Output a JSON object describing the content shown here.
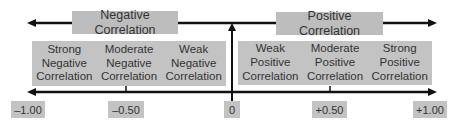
{
  "top": {
    "negative_label": "Negative Correlation",
    "positive_label": "Positive Correlation"
  },
  "bands": {
    "negative": [
      {
        "label": "Strong\nNegative\nCorrelation"
      },
      {
        "label": "Moderate\nNegative\nCorrelation"
      },
      {
        "label": "Weak\nNegative\nCorrelation"
      }
    ],
    "positive": [
      {
        "label": "Weak\nPositive\nCorrelation"
      },
      {
        "label": "Moderate\nPositive\nCorrelation"
      },
      {
        "label": "Strong\nPositive\nCorrelation"
      }
    ]
  },
  "axis": {
    "ticks": [
      {
        "label": "–1.00"
      },
      {
        "label": "–0.50"
      },
      {
        "label": "0"
      },
      {
        "label": "+0.50"
      },
      {
        "label": "+1.00"
      }
    ]
  },
  "colors": {
    "box_fill": "#bdbdbd",
    "band_fill": "#c3c3c3",
    "line": "#111111"
  }
}
